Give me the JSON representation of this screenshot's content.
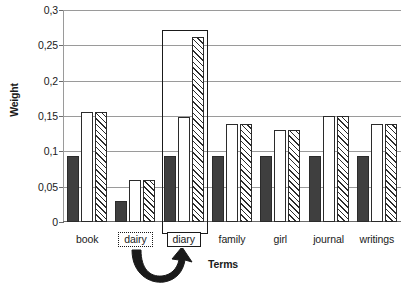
{
  "chart_data": {
    "type": "bar",
    "title": "",
    "xlabel": "Terms",
    "ylabel": "Weight",
    "categories": [
      "book",
      "dairy",
      "diary",
      "family",
      "girl",
      "journal",
      "writings"
    ],
    "series": [
      {
        "name": "series-a",
        "style": "solid-dark",
        "values": [
          0.093,
          0.03,
          0.093,
          0.093,
          0.093,
          0.093,
          0.093
        ]
      },
      {
        "name": "series-b",
        "style": "white-outline",
        "values": [
          0.156,
          0.06,
          0.148,
          0.138,
          0.13,
          0.15,
          0.138
        ]
      },
      {
        "name": "series-c",
        "style": "diagonal-hatch",
        "values": [
          0.156,
          0.06,
          0.262,
          0.138,
          0.13,
          0.15,
          0.138
        ]
      }
    ],
    "ylim": [
      0,
      0.3
    ],
    "yticks": [
      0,
      0.05,
      0.1,
      0.15,
      0.2,
      0.25,
      0.3
    ],
    "ytick_labels": [
      "0",
      "0,05",
      "0,1",
      "0,15",
      "0,2",
      "0,25",
      "0,3"
    ],
    "grid": true,
    "legend": "none",
    "annotations": {
      "highlighted_category": "diary",
      "highlight_style": "solid-rectangle",
      "dotted_box_category": "dairy",
      "arrow": "curved-arrow-from-dairy-to-diary"
    }
  },
  "axis": {
    "y_title": "Weight",
    "x_title": "Terms"
  },
  "colors": {
    "gridline": "#9a9a9a",
    "axis": "#6b6b6b",
    "bar_dark": "#3f3f3f",
    "bar_outline": "#2b2b2b",
    "annotation": "#1a1a1a",
    "background": "#ffffff"
  }
}
